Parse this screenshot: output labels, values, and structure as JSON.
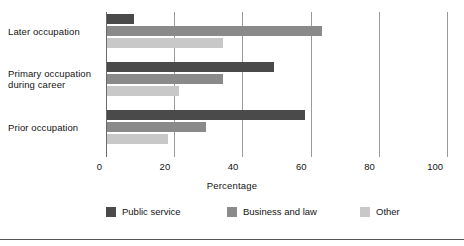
{
  "chart_data": {
    "type": "bar",
    "orientation": "horizontal",
    "title": "",
    "xlabel": "Percentage",
    "ylabel": "",
    "xlim": [
      0,
      100
    ],
    "xticks": [
      0,
      20,
      40,
      60,
      80,
      100
    ],
    "xtick_labels": [
      "0",
      "20",
      "40",
      "60",
      "80",
      "100"
    ],
    "grid": "vertical",
    "legend_position": "bottom",
    "categories": [
      "Later occupation",
      "Primary occupation during career",
      "Prior occupation"
    ],
    "category_label_lines": [
      [
        "Later occupation"
      ],
      [
        "Primary occupation",
        "during career"
      ],
      [
        "Prior occupation"
      ]
    ],
    "series": [
      {
        "name": "Public service",
        "color": "#4a4a4a",
        "values": [
          8,
          49,
          58
        ]
      },
      {
        "name": "Business and law",
        "color": "#8a8a8a",
        "values": [
          63,
          34,
          29
        ]
      },
      {
        "name": "Other",
        "color": "#c8c8c8",
        "values": [
          34,
          21,
          18
        ]
      }
    ]
  },
  "legend": {
    "items": [
      {
        "label": "Public service"
      },
      {
        "label": "Business and law"
      },
      {
        "label": "Other"
      }
    ]
  },
  "axis": {
    "x_title": "Percentage"
  }
}
